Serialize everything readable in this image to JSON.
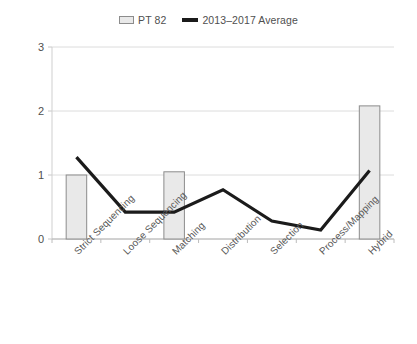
{
  "chart_data": {
    "type": "bar",
    "title": "",
    "subtitle": "",
    "xlabel": "",
    "ylabel": "",
    "ylim": [
      0,
      3
    ],
    "yticks": [
      0,
      1,
      2,
      3
    ],
    "ytick_labels": [
      "0",
      "1",
      "2",
      "3"
    ],
    "grid": true,
    "legend_position": "top-center",
    "categories": [
      "Strict Sequencing",
      "Loose Sequencing",
      "Matching",
      "Distribution",
      "Selection",
      "Process/Mapping",
      "Hybrid"
    ],
    "series": [
      {
        "name": "PT 82",
        "type": "bar",
        "color": "#e9e9e9",
        "edge_color": "#8c8c8c",
        "values": [
          1.0,
          0,
          1.05,
          0,
          0,
          0,
          2.08
        ]
      },
      {
        "name": "2013–2017 Average",
        "type": "line",
        "color": "#1b1b1b",
        "values": [
          1.28,
          0.42,
          0.42,
          0.77,
          0.28,
          0.14,
          1.07
        ]
      }
    ]
  },
  "legend": {
    "entries": [
      {
        "label": "PT 82",
        "marker": "bar-swatch-icon"
      },
      {
        "label": "2013–2017 Average",
        "marker": "line-swatch-icon"
      }
    ]
  }
}
